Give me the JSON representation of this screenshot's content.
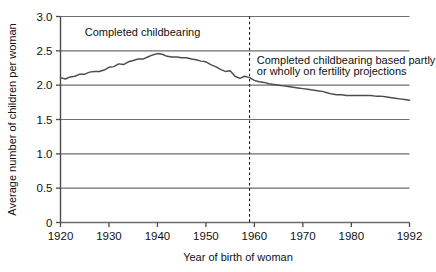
{
  "chart_data": {
    "type": "line",
    "title": "",
    "xlabel": "Year of birth of woman",
    "ylabel": "Average number of children per woman",
    "xlim": [
      1920,
      1992
    ],
    "ylim": [
      0,
      3.0
    ],
    "grid": true,
    "legend_position": "none",
    "y_ticks": [
      "0",
      "0.5",
      "1.0",
      "1.5",
      "2.0",
      "2.5",
      "3.0"
    ],
    "y_tick_values": [
      0,
      0.5,
      1.0,
      1.5,
      2.0,
      2.5,
      3.0
    ],
    "x_ticks": [
      "1920",
      "1930",
      "1940",
      "1950",
      "1960",
      "1970",
      "1980",
      "1992"
    ],
    "x_tick_values": [
      1920,
      1930,
      1940,
      1950,
      1960,
      1970,
      1980,
      1992
    ],
    "annotations": [
      {
        "name": "completed-childbearing-label",
        "text": "Completed childbearing",
        "x": 1925.0,
        "y": 2.78
      },
      {
        "name": "projection-label-line1",
        "text": "Completed childbearing based partly",
        "x": 1960.5,
        "y": 2.37
      },
      {
        "name": "projection-label-line2",
        "text": "or wholly on fertility projections",
        "x": 1960.5,
        "y": 2.21
      }
    ],
    "vline": {
      "name": "projection-divider",
      "x": 1959,
      "style": "dashed",
      "ymin": 0,
      "ymax": 3.0
    },
    "series": [
      {
        "name": "Average number of children per woman",
        "color": "#4d4d4d",
        "x": [
          1920,
          1921,
          1922,
          1923,
          1924,
          1925,
          1926,
          1927,
          1928,
          1929,
          1930,
          1931,
          1932,
          1933,
          1934,
          1935,
          1936,
          1937,
          1938,
          1939,
          1940,
          1941,
          1942,
          1943,
          1944,
          1945,
          1946,
          1947,
          1948,
          1949,
          1950,
          1951,
          1952,
          1953,
          1954,
          1955,
          1956,
          1957,
          1958,
          1959,
          1960,
          1961,
          1962,
          1963,
          1964,
          1965,
          1966,
          1967,
          1968,
          1969,
          1970,
          1971,
          1972,
          1973,
          1974,
          1975,
          1976,
          1977,
          1978,
          1979,
          1980,
          1981,
          1982,
          1983,
          1984,
          1985,
          1986,
          1987,
          1988,
          1989,
          1990,
          1991,
          1992
        ],
        "y": [
          2.11,
          2.09,
          2.12,
          2.13,
          2.16,
          2.16,
          2.19,
          2.2,
          2.2,
          2.22,
          2.26,
          2.27,
          2.31,
          2.3,
          2.34,
          2.36,
          2.38,
          2.38,
          2.41,
          2.44,
          2.46,
          2.45,
          2.42,
          2.41,
          2.41,
          2.4,
          2.4,
          2.38,
          2.37,
          2.35,
          2.34,
          2.3,
          2.27,
          2.23,
          2.2,
          2.21,
          2.13,
          2.1,
          2.13,
          2.11,
          2.07,
          2.05,
          2.04,
          2.02,
          2.01,
          2.0,
          1.99,
          1.98,
          1.97,
          1.96,
          1.95,
          1.94,
          1.93,
          1.92,
          1.91,
          1.89,
          1.87,
          1.86,
          1.86,
          1.85,
          1.85,
          1.85,
          1.85,
          1.85,
          1.85,
          1.84,
          1.84,
          1.83,
          1.82,
          1.81,
          1.8,
          1.79,
          1.78
        ]
      }
    ]
  }
}
